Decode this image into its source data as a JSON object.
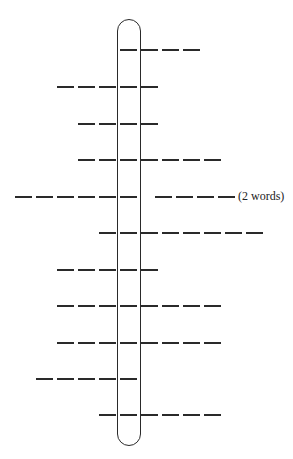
{
  "puzzle": {
    "type": "vertical-acrostic-word-puzzle",
    "highlight_column": "capsule",
    "line_color": "#2a2a2a",
    "rows": [
      {
        "index": 1,
        "y": 49,
        "words": [
          {
            "start_x": 120,
            "letters": 4
          }
        ]
      },
      {
        "index": 2,
        "y": 86,
        "words": [
          {
            "start_x": 57,
            "letters": 5
          }
        ]
      },
      {
        "index": 3,
        "y": 123,
        "words": [
          {
            "start_x": 78,
            "letters": 4
          }
        ]
      },
      {
        "index": 4,
        "y": 159,
        "words": [
          {
            "start_x": 78,
            "letters": 7
          }
        ]
      },
      {
        "index": 5,
        "y": 196,
        "words": [
          {
            "start_x": 15,
            "letters": 6
          },
          {
            "start_x": 155,
            "letters": 4
          }
        ],
        "note": "(2 words)"
      },
      {
        "index": 6,
        "y": 232,
        "words": [
          {
            "start_x": 99,
            "letters": 8
          }
        ]
      },
      {
        "index": 7,
        "y": 269,
        "words": [
          {
            "start_x": 57,
            "letters": 5
          }
        ]
      },
      {
        "index": 8,
        "y": 305,
        "words": [
          {
            "start_x": 57,
            "letters": 8
          }
        ]
      },
      {
        "index": 9,
        "y": 342,
        "words": [
          {
            "start_x": 57,
            "letters": 8
          }
        ]
      },
      {
        "index": 10,
        "y": 378,
        "words": [
          {
            "start_x": 36,
            "letters": 5
          }
        ]
      },
      {
        "index": 11,
        "y": 414,
        "words": [
          {
            "start_x": 99,
            "letters": 6
          }
        ]
      }
    ],
    "notes": {
      "row5": "(2 words)"
    }
  }
}
